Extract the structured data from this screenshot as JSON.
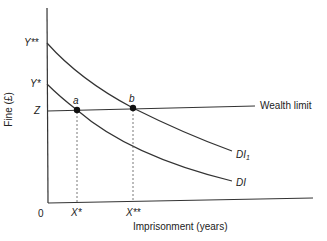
{
  "diagram": {
    "y_axis_label": "Fine (£)",
    "x_axis_label": "Imprisonment (years)",
    "origin_label": "0",
    "y_ticks": {
      "y_double_star": "Y**",
      "y_star": "Y*",
      "z": "Z"
    },
    "x_ticks": {
      "x_star": "X*",
      "x_double_star": "X**"
    },
    "points": {
      "a": "a",
      "b": "b"
    },
    "lines": {
      "wealth_limit": "Wealth limit",
      "di1_main": "DI",
      "di1_sub": "1",
      "di": "DI"
    },
    "colors": {
      "ink": "#222222",
      "background": "#ffffff"
    }
  }
}
